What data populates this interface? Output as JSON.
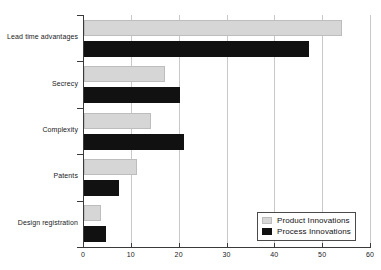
{
  "chart_data": {
    "type": "bar",
    "orientation": "horizontal",
    "title": "",
    "subtitle": "",
    "xlabel": "",
    "ylabel": "",
    "xlim": [
      0,
      60
    ],
    "xticks": [
      0,
      10,
      20,
      30,
      40,
      50,
      60
    ],
    "xtick_labels": [
      "0",
      "10",
      "20",
      "30",
      "40",
      "50",
      "60"
    ],
    "grid": true,
    "grid_axis": "x",
    "legend_position": "bottom-right",
    "categories": [
      "Lead time advantages",
      "Secrecy",
      "Complexity",
      "Patents",
      "Design registration"
    ],
    "series": [
      {
        "name": "Product Innovations",
        "color": "#d6d6d6",
        "values": [
          54,
          17,
          14,
          11,
          3.5
        ]
      },
      {
        "name": "Process Innovations",
        "color": "#111111",
        "values": [
          47,
          20,
          21,
          7.3,
          4.5
        ]
      }
    ]
  },
  "legend": {
    "items": [
      {
        "label": "Product Innovations",
        "swatch": "product"
      },
      {
        "label": "Process Innovations",
        "swatch": "process"
      }
    ]
  }
}
